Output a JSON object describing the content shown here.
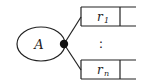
{
  "diagram": {
    "entity": {
      "label": "A"
    },
    "relations": [
      {
        "label": "r",
        "subscript": "1"
      },
      {
        "label": "r",
        "subscript": "n"
      }
    ],
    "ellipsis": ":",
    "colors": {
      "stroke": "#222222",
      "background": "#ffffff"
    }
  }
}
